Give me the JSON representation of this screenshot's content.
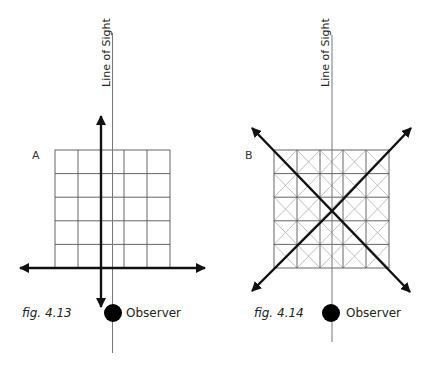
{
  "figures": [
    {
      "id": "A",
      "letter": "A",
      "caption": "fig. 4.13",
      "line_of_sight_label": "Line of Sight",
      "observer_label": "Observer",
      "grid": {
        "rows": 5,
        "cols": 5,
        "diagonals": false
      },
      "axes": "orthogonal (vertical and horizontal double arrows)"
    },
    {
      "id": "B",
      "letter": "B",
      "caption": "fig. 4.14",
      "line_of_sight_label": "Line of Sight",
      "observer_label": "Observer",
      "grid": {
        "rows": 5,
        "cols": 5,
        "diagonals": true
      },
      "axes": "diagonal (two crossing double arrows at 45°)"
    }
  ],
  "colors": {
    "grid_line": "#555555",
    "grid_diagonal": "#b0b0b0",
    "line_of_sight": "#777777",
    "arrow": "#111111",
    "observer_dot": "#000000"
  }
}
